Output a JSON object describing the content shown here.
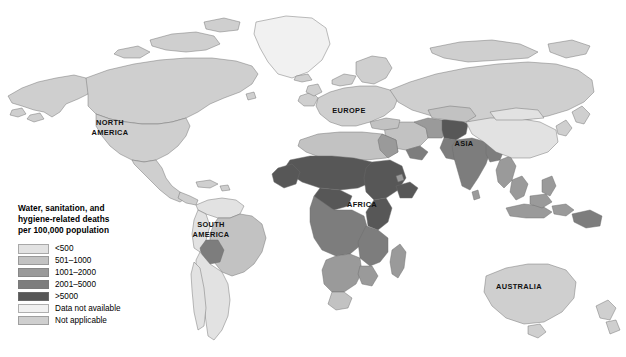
{
  "map": {
    "title_on_image": "",
    "projection": "world",
    "region_labels": [
      {
        "name": "north-america",
        "text": "NORTH\nAMERICA",
        "x": 110,
        "y": 127
      },
      {
        "name": "south-america",
        "text": "SOUTH\nAMERICA",
        "x": 211,
        "y": 229
      },
      {
        "name": "europe",
        "text": "EUROPE",
        "x": 349,
        "y": 111
      },
      {
        "name": "africa",
        "text": "AFRICA",
        "x": 362,
        "y": 205
      },
      {
        "name": "asia",
        "text": "ASIA",
        "x": 464,
        "y": 144
      },
      {
        "name": "australia",
        "text": "AUSTRALIA",
        "x": 519,
        "y": 287
      }
    ]
  },
  "legend": {
    "title_lines": [
      "Water, sanitation, and",
      "hygiene-related deaths",
      "per 100,000 population"
    ],
    "entries": [
      {
        "label": "<500",
        "color": "#e2e2e2"
      },
      {
        "label": "501–1000",
        "color": "#c2c2c2"
      },
      {
        "label": "1001–2000",
        "color": "#9a9a9a"
      },
      {
        "label": "2001–5000",
        "color": "#7d7d7d"
      },
      {
        "label": ">5000",
        "color": "#575757"
      },
      {
        "label": "Data not available",
        "color": "#f1f1f1"
      },
      {
        "label": "Not applicable",
        "color": "#cfcfcf"
      }
    ]
  },
  "chart_data": {
    "type": "choropleth-map",
    "title": "Water, sanitation, and hygiene-related deaths per 100,000 population",
    "unit": "deaths per 100,000 population",
    "legend_position": "lower-left",
    "classes": [
      {
        "label": "<500",
        "min": 0,
        "max": 500,
        "color": "#e2e2e2"
      },
      {
        "label": "501–1000",
        "min": 501,
        "max": 1000,
        "color": "#c2c2c2"
      },
      {
        "label": "1001–2000",
        "min": 1001,
        "max": 2000,
        "color": "#9a9a9a"
      },
      {
        "label": "2001–5000",
        "min": 2001,
        "max": 5000,
        "color": "#7d7d7d"
      },
      {
        "label": ">5000",
        "min": 5001,
        "max": null,
        "color": "#575757"
      },
      {
        "label": "Data not available",
        "min": null,
        "max": null,
        "color": "#f1f1f1"
      },
      {
        "label": "Not applicable",
        "min": null,
        "max": null,
        "color": "#cfcfcf"
      }
    ],
    "regions_shaded": [
      {
        "region": "North America",
        "class": "Not applicable"
      },
      {
        "region": "Greenland",
        "class": "Data not available"
      },
      {
        "region": "South America (most)",
        "class": "<500"
      },
      {
        "region": "Bolivia",
        "class": "1001–2000"
      },
      {
        "region": "Europe",
        "class": "Not applicable"
      },
      {
        "region": "North Africa",
        "class": "501–1000"
      },
      {
        "region": "Sahel / West Africa",
        "class": ">5000"
      },
      {
        "region": "Central Africa",
        "class": "2001–5000"
      },
      {
        "region": "East Africa",
        "class": ">5000"
      },
      {
        "region": "Southern Africa",
        "class": "1001–2000"
      },
      {
        "region": "Middle East",
        "class": "501–1000"
      },
      {
        "region": "Yemen",
        "class": "2001–5000"
      },
      {
        "region": "India",
        "class": "2001–5000"
      },
      {
        "region": "Pakistan",
        "class": "2001–5000"
      },
      {
        "region": "Afghanistan",
        "class": ">5000"
      },
      {
        "region": "China",
        "class": "<500"
      },
      {
        "region": "Southeast Asia",
        "class": "1001–2000"
      },
      {
        "region": "Indonesia / Papua",
        "class": "1001–2000"
      },
      {
        "region": "Australia",
        "class": "Not applicable"
      }
    ]
  }
}
